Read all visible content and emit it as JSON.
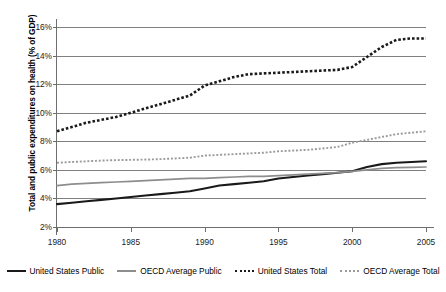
{
  "chart_data": {
    "type": "line",
    "title": "",
    "xlabel": "",
    "ylabel": "Total and public expenditures on health (% of GDP)",
    "xlim": [
      1980,
      2005
    ],
    "ylim": [
      2,
      16
    ],
    "ytick_labels": [
      "2%",
      "4%",
      "6%",
      "8%",
      "10%",
      "12%",
      "14%",
      "16%"
    ],
    "ytick_values": [
      2,
      4,
      6,
      8,
      10,
      12,
      14,
      16
    ],
    "xtick_labels": [
      "1980",
      "1985",
      "1990",
      "1995",
      "2000",
      "2005"
    ],
    "xtick_values": [
      1980,
      1985,
      1990,
      1995,
      2000,
      2005
    ],
    "grid": "horizontal",
    "legend_position": "bottom",
    "x": [
      1980,
      1981,
      1982,
      1983,
      1984,
      1985,
      1986,
      1987,
      1988,
      1989,
      1990,
      1991,
      1992,
      1993,
      1994,
      1995,
      1996,
      1997,
      1998,
      1999,
      2000,
      2001,
      2002,
      2003,
      2004,
      2005
    ],
    "series": [
      {
        "name": "United States Public",
        "style": "solid",
        "color": "#1a1a1a",
        "values": [
          3.6,
          3.7,
          3.8,
          3.9,
          4.0,
          4.1,
          4.2,
          4.3,
          4.4,
          4.5,
          4.7,
          4.9,
          5.0,
          5.1,
          5.2,
          5.4,
          5.5,
          5.6,
          5.7,
          5.8,
          5.9,
          6.2,
          6.4,
          6.5,
          6.55,
          6.6
        ]
      },
      {
        "name": "OECD Average Public",
        "style": "solid",
        "color": "#8d8d8d",
        "values": [
          4.9,
          5.0,
          5.05,
          5.1,
          5.15,
          5.2,
          5.25,
          5.3,
          5.35,
          5.4,
          5.4,
          5.45,
          5.5,
          5.55,
          5.55,
          5.6,
          5.65,
          5.7,
          5.75,
          5.8,
          5.9,
          6.0,
          6.1,
          6.15,
          6.18,
          6.2
        ]
      },
      {
        "name": "United States Total",
        "style": "dotted",
        "color": "#1a1a1a",
        "values": [
          8.7,
          9.0,
          9.3,
          9.5,
          9.7,
          10.0,
          10.3,
          10.6,
          10.9,
          11.2,
          11.9,
          12.2,
          12.5,
          12.7,
          12.75,
          12.8,
          12.85,
          12.9,
          12.95,
          13.0,
          13.2,
          13.9,
          14.6,
          15.1,
          15.2,
          15.2
        ]
      },
      {
        "name": "OECD Average Total",
        "style": "dotted",
        "color": "#9b9b9b",
        "values": [
          6.5,
          6.55,
          6.6,
          6.65,
          6.68,
          6.7,
          6.72,
          6.75,
          6.8,
          6.85,
          7.0,
          7.05,
          7.1,
          7.15,
          7.2,
          7.3,
          7.35,
          7.4,
          7.5,
          7.6,
          7.9,
          8.1,
          8.3,
          8.5,
          8.6,
          8.7
        ]
      }
    ]
  },
  "legend": {
    "entries": [
      {
        "label": "United States Public"
      },
      {
        "label": "OECD Average Public"
      },
      {
        "label": "United States Total"
      },
      {
        "label": "OECD Average Total"
      }
    ]
  }
}
